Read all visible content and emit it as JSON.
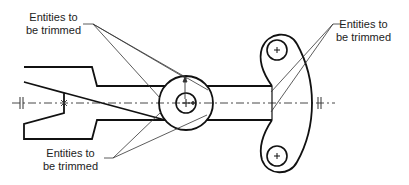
{
  "diagram": {
    "type": "cad-trim-illustration",
    "annotations": [
      {
        "id": "top-left",
        "line1": "Entities to",
        "line2": "be trimmed"
      },
      {
        "id": "top-right",
        "line1": "Entities to",
        "line2": "be trimmed"
      },
      {
        "id": "bottom-left",
        "line1": "Entities to",
        "line2": "be trimmed"
      }
    ],
    "colors": {
      "stroke": "#111111",
      "leader": "#333333",
      "centerline": "#333333",
      "background": "#ffffff"
    }
  }
}
